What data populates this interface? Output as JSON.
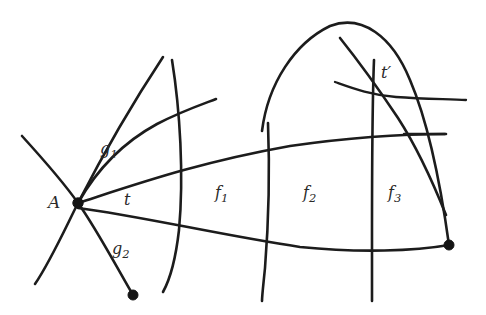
{
  "figure": {
    "background_color": "#ffffff",
    "stroke_color": "#1c1c1c",
    "width": 486,
    "height": 315,
    "labels": {
      "vertex_A": "A",
      "region_g1": "g",
      "region_g1_sub": "1",
      "region_g2": "g",
      "region_g2_sub": "2",
      "region_t": "t",
      "region_f1": "f",
      "region_f1_sub": "1",
      "region_f2": "f",
      "region_f2_sub": "2",
      "region_f3": "f",
      "region_f3_sub": "3",
      "region_t_prime": "t′"
    },
    "vertices": [
      {
        "name": "A",
        "x": 78,
        "y": 203,
        "radius": 5.2
      },
      {
        "name": "bottom-vertex",
        "x": 133,
        "y": 295,
        "radius": 5.0
      },
      {
        "name": "right-vertex",
        "x": 449,
        "y": 245,
        "radius": 5.0
      }
    ],
    "regions": [
      {
        "id": "g1",
        "label": "g₁",
        "label_x": 107,
        "label_y": 152
      },
      {
        "id": "g2",
        "label": "g₂",
        "label_x": 119,
        "label_y": 252
      },
      {
        "id": "t",
        "label": "t",
        "label_x": 129,
        "label_y": 203
      },
      {
        "id": "f1",
        "label": "f₁",
        "label_x": 222,
        "label_y": 196
      },
      {
        "id": "f2",
        "label": "f₂",
        "label_x": 310,
        "label_y": 196
      },
      {
        "id": "f3",
        "label": "f₃",
        "label_x": 395,
        "label_y": 196
      },
      {
        "id": "tprime",
        "label": "t′",
        "label_x": 387,
        "label_y": 76
      }
    ],
    "curves": [
      {
        "id": "cross-nw-se",
        "path": "M 22 136 C 42 158 62 180 78 203 C 96 228 116 266 133 295"
      },
      {
        "id": "cross-sw-ne",
        "path": "M 35 284 C 50 262 64 231 78 203 C 96 168 126 113 163 57"
      },
      {
        "id": "arc-g1-upper",
        "path": "M 78 203 C 96 171 122 143 157 124 C 182 111 203 104 216 99"
      },
      {
        "id": "long-upper-chord",
        "path": "M 78 203 C 140 183 200 162 290 146 C 360 136 415 134 446 134"
      },
      {
        "id": "long-lower-chord",
        "path": "M 78 208 C 140 216 220 235 300 247 C 360 253 415 251 449 245"
      },
      {
        "id": "vertical-f0-f1",
        "path": "M 172 60 C 180 110 184 175 179 230 C 175 265 168 283 163 292"
      },
      {
        "id": "vertical-f1-f2",
        "path": "M 268 123 C 270 175 268 230 265 268 C 263 288 262 296 262 301"
      },
      {
        "id": "big-arch-f2-f3",
        "path": "M 262 131 C 268 83 295 43 330 26 C 362 14 392 36 410 80 C 428 122 440 180 449 245"
      },
      {
        "id": "vertical-tprime-left",
        "path": "M 374 60 C 372 110 372 185 372 240 C 372 275 372 292 372 301"
      },
      {
        "id": "slant-tprime-right",
        "path": "M 340 38 C 356 58 378 88 398 118 C 420 152 436 190 446 215"
      },
      {
        "id": "short-horizontal-tprime",
        "path": "M 335 82 C 352 88 370 95 396 97 C 424 99 448 99 466 100"
      },
      {
        "id": "short-horizontal-upper-right",
        "path": "M 404 134 C 420 134 434 134 445 134"
      }
    ]
  }
}
